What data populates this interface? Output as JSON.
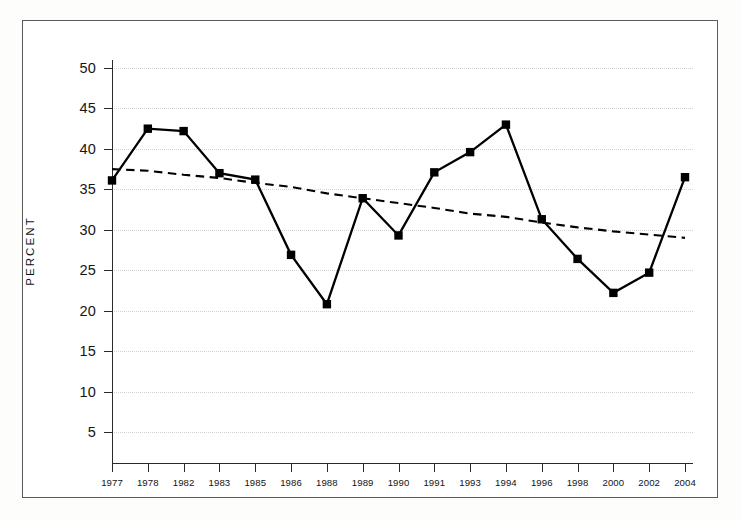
{
  "chart_data": {
    "type": "line",
    "title": "",
    "xlabel": "",
    "ylabel": "PERCENT",
    "ylim": [
      0,
      50
    ],
    "yticks": [
      5,
      10,
      15,
      20,
      25,
      30,
      35,
      40,
      45,
      50
    ],
    "grid": true,
    "legend": "none",
    "categories": [
      "1977",
      "1978",
      "1982",
      "1983",
      "1985",
      "1986",
      "1988",
      "1989",
      "1990",
      "1991",
      "1993",
      "1994",
      "1996",
      "1998",
      "2000",
      "2002",
      "2004"
    ],
    "series": [
      {
        "name": "percent",
        "style": "solid-line-square-markers",
        "color": "#000000",
        "values": [
          36.1,
          42.5,
          42.2,
          37.0,
          36.2,
          26.9,
          20.8,
          33.9,
          29.3,
          37.1,
          39.6,
          43.0,
          31.3,
          26.4,
          22.2,
          24.7,
          36.5
        ]
      },
      {
        "name": "trend",
        "style": "dashed-line",
        "color": "#000000",
        "values": [
          37.5,
          37.3,
          36.8,
          36.4,
          35.8,
          35.3,
          34.5,
          33.9,
          33.3,
          32.7,
          32.0,
          31.6,
          30.9,
          30.3,
          29.8,
          29.4,
          29.0
        ]
      }
    ]
  },
  "axis": {
    "y_title": "PERCENT"
  }
}
